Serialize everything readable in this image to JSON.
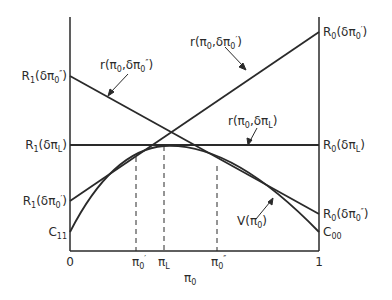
{
  "diagram": {
    "axes": {
      "x_label": "π",
      "x_label_sub": "0",
      "x_origin": "0",
      "x_end": "1",
      "x_markers": [
        {
          "sym": "π",
          "sub": "0",
          "prime": "′",
          "x": 136
        },
        {
          "sym": "π",
          "sub": "L",
          "prime": "",
          "x": 164
        },
        {
          "sym": "π",
          "sub": "0",
          "prime": "″",
          "x": 217
        }
      ]
    },
    "left_labels": [
      {
        "id": "R1_dpi0pp",
        "text": "R",
        "sub": "1",
        "arg": "(δπ",
        "argsub": "0",
        "prime": "″",
        "close": ")",
        "y": 76
      },
      {
        "id": "R1_dpiL",
        "text": "R",
        "sub": "1",
        "arg": "(δπ",
        "argsub": "L",
        "prime": "",
        "close": ")",
        "y": 145
      },
      {
        "id": "R1_dpi0p",
        "text": "R",
        "sub": "1",
        "arg": "(δπ",
        "argsub": "0",
        "prime": "′",
        "close": ")",
        "y": 201
      },
      {
        "id": "C11",
        "text": "C",
        "sub": "11",
        "y": 232
      }
    ],
    "right_labels": [
      {
        "id": "R0_dpi0p",
        "text": "R",
        "sub": "0",
        "arg": "(δπ",
        "argsub": "0",
        "prime": "′",
        "close": ")",
        "y": 32
      },
      {
        "id": "R0_dpiL",
        "text": "R",
        "sub": "0",
        "arg": "(δπ",
        "argsub": "L",
        "prime": "",
        "close": ")",
        "y": 145
      },
      {
        "id": "R0_dpi0pp",
        "text": "R",
        "sub": "0",
        "arg": "(δπ",
        "argsub": "0",
        "prime": "″",
        "close": ")",
        "y": 214
      },
      {
        "id": "C00",
        "text": "C",
        "sub": "00",
        "y": 232
      }
    ],
    "curve_labels": {
      "r_pp": "r(π₀,δπ₀″)",
      "r_p": "r(π₀,δπ₀′)",
      "r_L": "r(π₀,δπ_L)",
      "V": "V(π₀)"
    },
    "lines": [
      {
        "name": "r(π0,δπ0'')",
        "from": [
          70,
          76
        ],
        "to": [
          319,
          214
        ]
      },
      {
        "name": "r(π0,δπ0')",
        "from": [
          70,
          201
        ],
        "to": [
          319,
          32
        ]
      },
      {
        "name": "r(π0,δπL)",
        "from": [
          70,
          145
        ],
        "to": [
          319,
          145
        ]
      }
    ],
    "curve_V": {
      "start": [
        70,
        232
      ],
      "peak": [
        164,
        146
      ],
      "end": [
        319,
        232
      ]
    }
  }
}
